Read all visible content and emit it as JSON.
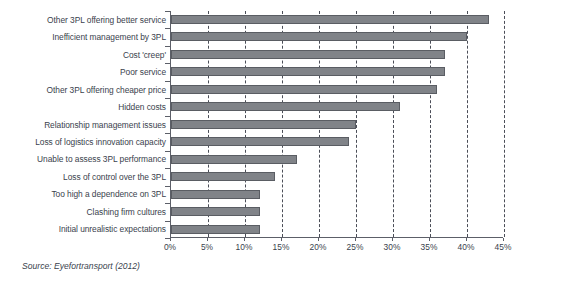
{
  "source_note": "Source: Eyefortransport (2012)",
  "chart_data": {
    "type": "bar",
    "orientation": "horizontal",
    "title": "",
    "subtitle": "",
    "xlabel": "",
    "ylabel": "",
    "xlim": [
      0,
      45
    ],
    "x_tick_labels": [
      "0%",
      "5%",
      "10%",
      "15%",
      "20%",
      "25%",
      "30%",
      "35%",
      "40%",
      "45%"
    ],
    "x_ticks": [
      0,
      5,
      10,
      15,
      20,
      25,
      30,
      35,
      40,
      45
    ],
    "grid": "vertical-dashed",
    "legend": "none",
    "bar_color": "#808388",
    "bar_border_color": "#5a5d63",
    "categories": [
      "Other 3PL offering better service",
      "Inefficient management by 3PL",
      "Cost 'creep'",
      "Poor service",
      "Other 3PL offering cheaper price",
      "Hidden costs",
      "Relationship management issues",
      "Loss of logistics innovation capacity",
      "Unable to assess 3PL performance",
      "Loss of control over the 3PL",
      "Too high a dependence on 3PL",
      "Clashing firm cultures",
      "Initial unrealistic expectations"
    ],
    "values": [
      43,
      40,
      37,
      37,
      36,
      31,
      25,
      24,
      17,
      14,
      12,
      12,
      12
    ],
    "value_unit": "%"
  }
}
